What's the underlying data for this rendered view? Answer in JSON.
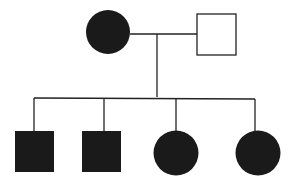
{
  "diagram": {
    "type": "pedigree",
    "colors": {
      "affected": "#1a1a1a",
      "unaffected": "#ffffff",
      "line": "#222222"
    },
    "generation1": [
      {
        "id": "mother",
        "sex": "female",
        "affected": true
      },
      {
        "id": "father",
        "sex": "male",
        "affected": false
      }
    ],
    "generation2": [
      {
        "id": "child-1",
        "sex": "male",
        "affected": true
      },
      {
        "id": "child-2",
        "sex": "male",
        "affected": true
      },
      {
        "id": "child-3",
        "sex": "female",
        "affected": true
      },
      {
        "id": "child-4",
        "sex": "female",
        "affected": true
      }
    ]
  }
}
